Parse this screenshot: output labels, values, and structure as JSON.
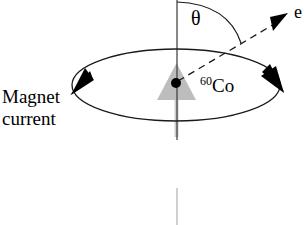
{
  "figure": {
    "background_color": "#ffffff"
  },
  "labels": {
    "magnet_current_line1": "Magnet",
    "magnet_current_line2": "current",
    "theta": "θ",
    "cobalt_superscript": "60",
    "cobalt_symbol": "Co",
    "electron": "e"
  },
  "colors": {
    "stroke": "#1a1a1a",
    "spin_arrow": "#b5b5b5",
    "spin_shaft": "#cfcfcf",
    "axis_faint": "#c8c8c8",
    "nucleus_dot": "#000000"
  },
  "geometry": {
    "canvas_width": 308,
    "canvas_height": 225,
    "ellipse": {
      "cx": 176,
      "cy": 85,
      "rx": 104,
      "ry": 36
    },
    "nucleus": {
      "x": 176,
      "y": 83,
      "r": 5
    },
    "vertical_axis": {
      "x": 177,
      "y_top": 0,
      "y_bottom": 140
    },
    "faint_axis_lower": {
      "x": 177,
      "y_top": 188,
      "y_bottom": 225
    },
    "electron_arrow": {
      "x1": 178,
      "y1": 81,
      "x2": 281,
      "y2": 20
    },
    "theta_arc": {
      "start_x": 177,
      "start_y": 2,
      "end_x": 240,
      "end_y": 42
    }
  },
  "elements": {
    "magnet_current_arrow_left": "left-tangent-arrowhead",
    "magnet_current_arrow_right": "right-tangent-arrowhead",
    "spin_arrow": "nuclear-spin-up-arrow",
    "electron_arrow": "dashed-electron-emission-arrow"
  }
}
